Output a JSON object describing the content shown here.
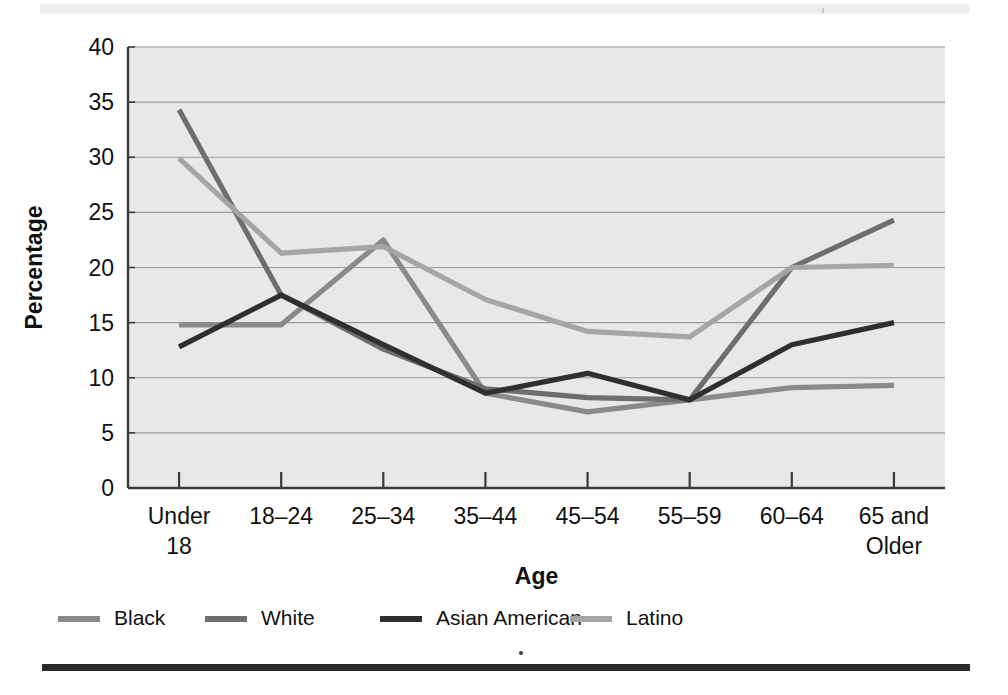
{
  "figure": {
    "bottom_rule": "page-rule",
    "top_band": "scan-band"
  },
  "chart_data": {
    "type": "line",
    "title": "",
    "xlabel": "Age",
    "ylabel": "Percentage",
    "categories": [
      "Under 18",
      "18–24",
      "25–34",
      "35–44",
      "45–54",
      "55–59",
      "60–64",
      "65 and Older"
    ],
    "category_lines": [
      [
        "Under",
        "18"
      ],
      [
        "18–24",
        ""
      ],
      [
        "25–34",
        ""
      ],
      [
        "35–44",
        ""
      ],
      [
        "45–54",
        ""
      ],
      [
        "55–59",
        ""
      ],
      [
        "60–64",
        ""
      ],
      [
        "65 and",
        "Older"
      ]
    ],
    "ylim": [
      0,
      40
    ],
    "yticks": [
      0,
      5,
      10,
      15,
      20,
      25,
      30,
      35,
      40
    ],
    "ytick_labels": [
      "0",
      "5",
      "10",
      "15",
      "20",
      "25",
      "30",
      "35",
      "40"
    ],
    "grid": "horizontal",
    "legend_position": "bottom-left",
    "series": [
      {
        "name": "Black",
        "color": "#8a8a8a",
        "values": [
          14.8,
          14.8,
          22.5,
          8.6,
          6.9,
          8.0,
          9.1,
          9.3
        ]
      },
      {
        "name": "White",
        "color": "#6e6e6e",
        "values": [
          34.3,
          17.5,
          12.6,
          9.0,
          8.2,
          8.0,
          20.0,
          24.3
        ]
      },
      {
        "name": "Asian American",
        "color": "#2f2f2f",
        "values": [
          12.8,
          17.5,
          13.0,
          8.6,
          10.4,
          8.0,
          13.0,
          15.0
        ]
      },
      {
        "name": "Latino",
        "color": "#a5a5a5",
        "values": [
          29.9,
          21.3,
          21.9,
          17.1,
          14.2,
          13.7,
          20.0,
          20.2
        ]
      }
    ],
    "series_overrides": {
      "White_path_note": "White descends steeply from Under 18 then rises after 55-59",
      "black_secondary_note": "Black rises to a peak at 25-34 then declines"
    },
    "colors": {
      "plot_background": "#e8e8e8",
      "gridline": "#9a9a9a",
      "axis": "#3a3a3a",
      "text": "#111111"
    }
  }
}
